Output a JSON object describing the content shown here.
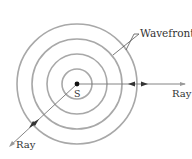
{
  "diagram": {
    "source": {
      "label": "S",
      "cx": 77,
      "cy": 84
    },
    "wavefronts": {
      "label": "Wavefronts",
      "radii": [
        15,
        30,
        45,
        60
      ],
      "color": "#a8a8a8"
    },
    "rays": [
      {
        "label": "Ray",
        "direction": "right"
      },
      {
        "label": "Ray",
        "direction": "down-left"
      }
    ],
    "colors": {
      "ray": "#777777",
      "arrow": "#333333",
      "wavefront": "#a8a8a8",
      "source": "#111111"
    }
  }
}
